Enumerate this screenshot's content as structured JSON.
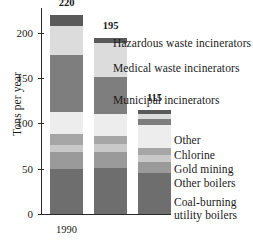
{
  "chart_data": {
    "type": "bar",
    "subtype": "stacked-bar",
    "title": "",
    "xlabel": "",
    "ylabel": "Tons per year",
    "categories": [
      "1990",
      "1996",
      "1999"
    ],
    "totals": [
      220,
      195,
      115
    ],
    "ylim": [
      0,
      220
    ],
    "yticks": [
      0,
      50,
      100,
      150,
      200
    ],
    "ytick_labels": [
      "0",
      "50",
      "100",
      "150",
      "200"
    ],
    "grid": false,
    "legend_position": "right-inline-annotations",
    "series": [
      {
        "name": "Coal-burning utility boilers",
        "color": "#6e6e6e",
        "values": [
          50,
          51,
          45
        ]
      },
      {
        "name": "Other boilers",
        "color": "#9a9a9a",
        "values": [
          18,
          18,
          12
        ]
      },
      {
        "name": "Gold mining",
        "color": "#c9c9c9",
        "values": [
          8,
          8,
          8
        ]
      },
      {
        "name": "Chlorine",
        "color": "#a6a6a6",
        "values": [
          12,
          9,
          8
        ]
      },
      {
        "name": "Other",
        "color": "#ededed",
        "values": [
          25,
          25,
          25
        ]
      },
      {
        "name": "Municipal incinerators",
        "color": "#7e7e7e",
        "values": [
          63,
          40,
          7
        ]
      },
      {
        "name": "Medical waste incinerators",
        "color": "#dcdcdc",
        "values": [
          32,
          38,
          5
        ]
      },
      {
        "name": "Hazardous waste incinerators",
        "color": "#5a5a5a",
        "values": [
          12,
          6,
          5
        ]
      }
    ],
    "annotations": [
      "Hazardous waste incinerators",
      "Medical waste incinerators",
      "Municipal incinerators",
      "Other",
      "Chlorine",
      "Gold mining",
      "Other boilers",
      "Coal-burning utility boilers"
    ]
  },
  "axis": {
    "y_title": "Tons per year",
    "tick_200": "200",
    "tick_150": "150",
    "tick_100": "100",
    "tick_50": "50",
    "tick_0": "0"
  },
  "bars": {
    "b0": {
      "category": "1990",
      "total": "220"
    },
    "b1": {
      "category": "1996",
      "total": "195"
    },
    "b2": {
      "category": "1999",
      "total": "115"
    }
  },
  "labels": {
    "hazardous": "Hazardous waste incinerators",
    "medical": "Medical waste incinerators",
    "municipal": "Municipal incinerators",
    "other": "Other",
    "chlorine": "Chlorine",
    "gold": "Gold mining",
    "other_boilers": "Other boilers",
    "coal_line1": "Coal-burning",
    "coal_line2": "utility boilers"
  }
}
